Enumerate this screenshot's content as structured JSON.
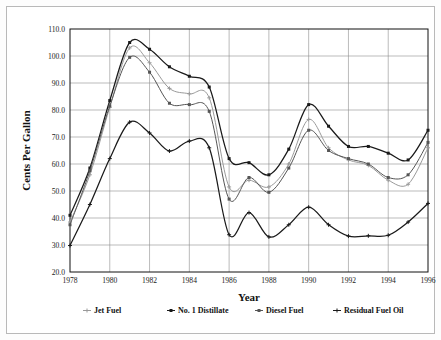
{
  "chart_data": {
    "type": "line",
    "title": "",
    "xlabel": "Year",
    "ylabel": "Cents Per Gallon",
    "xlim": [
      1978,
      1996
    ],
    "ylim": [
      20.0,
      110.0
    ],
    "ytick_step": 10.0,
    "xtick_step": 2,
    "grid": true,
    "legend_position": "bottom",
    "x": [
      1978,
      1979,
      1980,
      1981,
      1982,
      1983,
      1984,
      1985,
      1986,
      1987,
      1988,
      1989,
      1990,
      1991,
      1992,
      1993,
      1994,
      1995,
      1996
    ],
    "xtick_labels": [
      "1978",
      "1980",
      "1982",
      "1984",
      "1986",
      "1988",
      "1990",
      "1992",
      "1994",
      "1996"
    ],
    "ytick_labels": [
      "20.0",
      "30.0",
      "40.0",
      "50.0",
      "60.0",
      "70.0",
      "80.0",
      "90.0",
      "100.0",
      "110.0"
    ],
    "series": [
      {
        "name": "Jet Fuel",
        "color": "#9a9a9a",
        "marker": "plus",
        "values": [
          38.5,
          56.0,
          81.0,
          103.0,
          97.5,
          88.0,
          86.0,
          84.5,
          51.5,
          54.0,
          51.5,
          60.0,
          76.5,
          66.0,
          61.5,
          59.5,
          54.0,
          52.5,
          66.0
        ]
      },
      {
        "name": "No. 1 Distillate",
        "color": "#1a1a1a",
        "marker": "square",
        "values": [
          41.0,
          58.5,
          83.5,
          105.0,
          102.5,
          96.0,
          92.5,
          88.5,
          62.0,
          60.5,
          56.0,
          65.5,
          82.0,
          74.0,
          66.5,
          66.5,
          64.0,
          61.5,
          72.5
        ]
      },
      {
        "name": "Diesel Fuel",
        "color": "#555555",
        "marker": "square",
        "values": [
          37.5,
          57.5,
          81.5,
          99.5,
          94.0,
          82.5,
          82.0,
          79.5,
          47.0,
          55.0,
          49.5,
          58.5,
          72.5,
          65.0,
          62.0,
          60.0,
          55.0,
          56.0,
          68.0
        ]
      },
      {
        "name": "Residual Fuel Oil",
        "color": "#1a1a1a",
        "marker": "plus",
        "values": [
          29.8,
          45.0,
          62.0,
          75.5,
          71.5,
          64.8,
          68.5,
          66.0,
          33.8,
          42.0,
          33.0,
          37.5,
          44.0,
          37.5,
          33.3,
          33.4,
          33.6,
          38.5,
          45.4
        ]
      }
    ]
  },
  "legend": {
    "items": [
      {
        "label": "Jet Fuel"
      },
      {
        "label": "No. 1 Distillate"
      },
      {
        "label": "Diesel Fuel"
      },
      {
        "label": "Residual Fuel Oil"
      }
    ]
  }
}
